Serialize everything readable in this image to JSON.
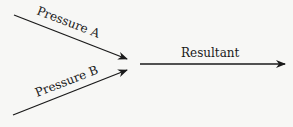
{
  "diagram": {
    "labels": {
      "pressure_a": "Pressure A",
      "pressure_b": "Pressure B",
      "resultant": "Resultant"
    },
    "colors": {
      "ink": "#1a1a1a",
      "background": "#f7f7f5"
    }
  }
}
